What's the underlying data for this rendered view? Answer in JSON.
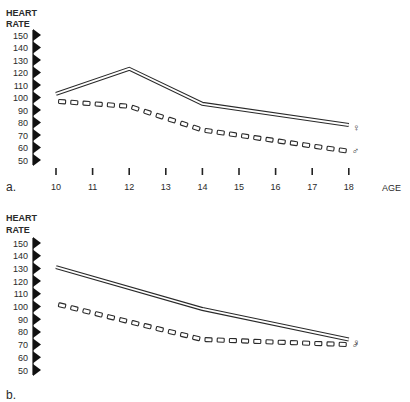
{
  "figure": {
    "panels": [
      {
        "id": "a",
        "panel_label": "a.",
        "ylabel_line1": "HEART",
        "ylabel_line2": "RATE",
        "xlabel": "AGE",
        "female_symbol": "♀",
        "male_symbol": "♂"
      },
      {
        "id": "b",
        "panel_label": "b.",
        "ylabel_line1": "HEART",
        "ylabel_line2": "RATE",
        "xlabel": "",
        "female_symbol": "♀",
        "male_symbol": "♂"
      }
    ]
  },
  "chart_data": [
    {
      "type": "line",
      "title": "a.",
      "xlabel": "AGE",
      "ylabel": "HEART RATE",
      "x": [
        10,
        11,
        12,
        13,
        14,
        15,
        16,
        17,
        18
      ],
      "x_ticks": [
        "10",
        "11",
        "12",
        "13",
        "14",
        "15",
        "16",
        "17",
        "18"
      ],
      "y_ticks": [
        "150",
        "140",
        "130",
        "120",
        "110",
        "100",
        "90",
        "80",
        "70",
        "60",
        "50"
      ],
      "ylim": [
        50,
        150
      ],
      "grid": false,
      "legend": "symbols at line ends (♀ female, ♂ male)",
      "series": [
        {
          "name": "Female (♀)",
          "style": "solid double line",
          "x": [
            10,
            12,
            14,
            18
          ],
          "values": [
            103,
            123,
            95,
            78
          ]
        },
        {
          "name": "Male (♂)",
          "style": "dashed (open rectangles)",
          "x": [
            10,
            12,
            14,
            18
          ],
          "values": [
            97,
            93,
            74,
            57
          ]
        }
      ]
    },
    {
      "type": "line",
      "title": "b.",
      "xlabel": "",
      "ylabel": "HEART RATE",
      "x": [
        10,
        14,
        18
      ],
      "x_ticks": [],
      "y_ticks": [
        "150",
        "140",
        "130",
        "120",
        "110",
        "100",
        "90",
        "80",
        "70",
        "60",
        "50"
      ],
      "ylim": [
        50,
        150
      ],
      "grid": false,
      "legend": "symbols at line ends (♀ female, ♂ male)",
      "series": [
        {
          "name": "Female (♀)",
          "style": "solid double line",
          "x": [
            10,
            14,
            18
          ],
          "values": [
            131,
            98,
            74
          ]
        },
        {
          "name": "Male (♂)",
          "style": "dashed (open rectangles)",
          "x": [
            10,
            14,
            18
          ],
          "values": [
            102,
            74,
            70
          ]
        }
      ]
    }
  ]
}
